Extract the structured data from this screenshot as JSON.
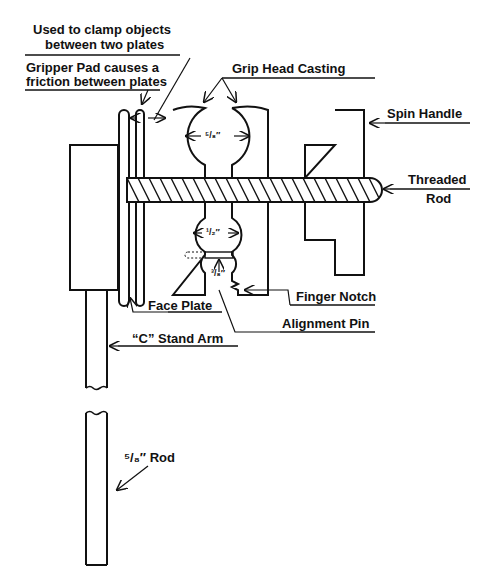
{
  "diagram": {
    "type": "mechanical-part-diagram",
    "labels": {
      "clamp_note_line1": "Used to clamp objects",
      "clamp_note_line2": "between two plates",
      "gripper_pad_line1": "Gripper Pad causes a",
      "gripper_pad_line2": "friction between plates",
      "grip_head_casting": "Grip Head Casting",
      "spin_handle": "Spin Handle",
      "threaded_rod_line1": "Threaded",
      "threaded_rod_line2": "Rod",
      "finger_notch": "Finger Notch",
      "alignment_pin": "Alignment Pin",
      "face_plate": "Face Plate",
      "c_stand_arm": "“C” Stand Arm",
      "rod": "⁵/₈″ Rod"
    },
    "dimensions": {
      "upper_opening": "⁵/₈″",
      "lower_opening": "¹/₂″",
      "smallest_opening": "³/₈″"
    },
    "colors": {
      "line": "#111111",
      "background": "#ffffff"
    }
  }
}
